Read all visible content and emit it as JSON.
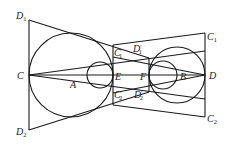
{
  "diagram": {
    "type": "geometry",
    "points": {
      "C": {
        "label": "C",
        "x": 29,
        "y": 75
      },
      "D": {
        "label": "D",
        "x": 205,
        "y": 75
      },
      "A": {
        "label": "A",
        "x": 71,
        "y": 75
      },
      "B": {
        "label": "B",
        "x": 177,
        "y": 75
      },
      "E": {
        "label": "E",
        "x": 113,
        "y": 75
      },
      "F": {
        "label": "F",
        "x": 149,
        "y": 75
      },
      "D1": {
        "label": "D",
        "sub": "1",
        "x": 29,
        "y": 20
      },
      "D2": {
        "label": "D",
        "sub": "2",
        "x": 29,
        "y": 130
      },
      "C1": {
        "label": "C",
        "sub": "1",
        "x": 205,
        "y": 33
      },
      "C2": {
        "label": "C",
        "sub": "2",
        "x": 205,
        "y": 117
      },
      "C1p": {
        "label": "C",
        "sub": "1",
        "prime": "′",
        "x": 113,
        "y": 45
      },
      "C2p": {
        "label": "C",
        "sub": "2",
        "prime": "′",
        "x": 113,
        "y": 105
      },
      "D1p": {
        "label": "D",
        "sub": "1",
        "prime": "′",
        "x": 149,
        "y": 58
      },
      "D2p": {
        "label": "D",
        "sub": "2",
        "prime": "′",
        "x": 149,
        "y": 92
      }
    },
    "circles": [
      {
        "name": "big-left",
        "cx": 71,
        "cy": 75,
        "r": 42
      },
      {
        "name": "small-left",
        "cx": 100,
        "cy": 75,
        "r": 13
      },
      {
        "name": "big-right",
        "cx": 177,
        "cy": 75,
        "r": 28
      },
      {
        "name": "small-right",
        "cx": 163,
        "cy": 75,
        "r": 14
      }
    ],
    "labels": {
      "C": "C",
      "D": "D",
      "A": "A",
      "B": "B",
      "E": "E",
      "F": "F",
      "D1": "D",
      "D2": "D",
      "C1": "C",
      "C2": "C",
      "C1p": "C",
      "C2p": "C",
      "D1p": "D",
      "D2p": "D",
      "sub1": "1",
      "sub2": "2",
      "prime": "′"
    }
  }
}
